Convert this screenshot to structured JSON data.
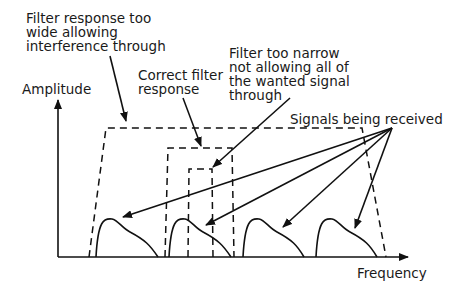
{
  "diagram": {
    "axes": {
      "y_label": "Amplitude",
      "x_label": "Frequency"
    },
    "annotations": {
      "wide_filter": [
        "Filter response too",
        "wide allowing",
        "interference through"
      ],
      "correct_filter": [
        "Correct filter",
        "response"
      ],
      "narrow_filter": [
        "Filter too narrow",
        "not allowing all of",
        "the wanted signal",
        "through"
      ],
      "signals": "Signals being received"
    },
    "filters": [
      {
        "name": "wide",
        "style": "dashed"
      },
      {
        "name": "correct",
        "style": "dashed"
      },
      {
        "name": "narrow",
        "style": "dashed"
      }
    ],
    "signal_count": 4
  }
}
